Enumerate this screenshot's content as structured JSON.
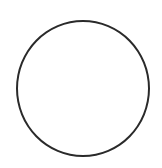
{
  "shape": {
    "type": "circle",
    "icon": "circle-outline-icon",
    "stroke_color": "#2a2a2a",
    "fill_color": "#ffffff",
    "background_color": "#ffffff"
  }
}
